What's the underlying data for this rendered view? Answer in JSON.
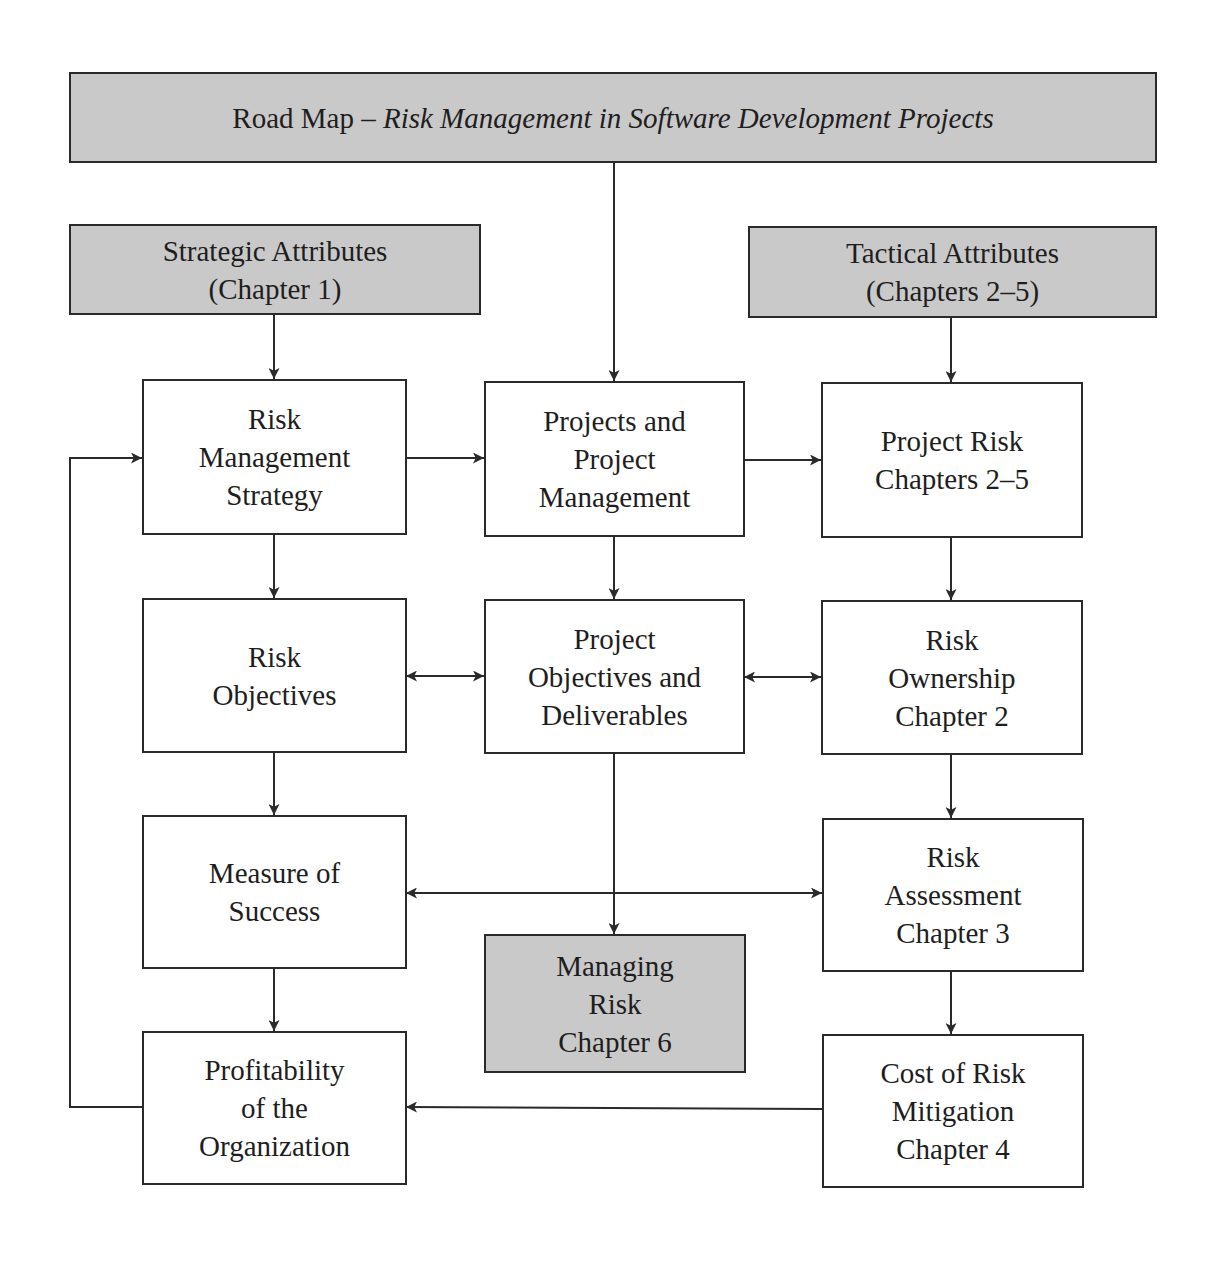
{
  "title": {
    "prefix": "Road Map – ",
    "italic": "Risk Management in Software Development Projects"
  },
  "nodes": {
    "strategic": {
      "lines": [
        "Strategic Attributes",
        "(Chapter 1)"
      ]
    },
    "tactical": {
      "lines": [
        "Tactical Attributes",
        "(Chapters 2–5)"
      ]
    },
    "rm_strategy": {
      "lines": [
        "Risk",
        "Management",
        "Strategy"
      ]
    },
    "projects": {
      "lines": [
        "Projects and",
        "Project",
        "Management"
      ]
    },
    "project_risk": {
      "lines": [
        "Project Risk",
        "Chapters 2–5"
      ]
    },
    "risk_objectives": {
      "lines": [
        "Risk",
        "Objectives"
      ]
    },
    "project_objectives": {
      "lines": [
        "Project",
        "Objectives and",
        "Deliverables"
      ]
    },
    "risk_ownership": {
      "lines": [
        "Risk",
        "Ownership",
        "Chapter 2"
      ]
    },
    "measure_success": {
      "lines": [
        "Measure of",
        "Success"
      ]
    },
    "managing_risk": {
      "lines": [
        "Managing",
        "Risk",
        "Chapter 6"
      ]
    },
    "risk_assessment": {
      "lines": [
        "Risk",
        "Assessment",
        "Chapter 3"
      ]
    },
    "profitability": {
      "lines": [
        "Profitability",
        "of the",
        "Organization"
      ]
    },
    "cost_mitigation": {
      "lines": [
        "Cost of Risk",
        "Mitigation",
        "Chapter 4"
      ]
    }
  },
  "edges": [
    {
      "from": "title",
      "to": "projects",
      "type": "one-way"
    },
    {
      "from": "strategic",
      "to": "rm_strategy",
      "type": "one-way"
    },
    {
      "from": "tactical",
      "to": "project_risk",
      "type": "one-way"
    },
    {
      "from": "rm_strategy",
      "to": "projects",
      "type": "one-way"
    },
    {
      "from": "projects",
      "to": "project_risk",
      "type": "one-way"
    },
    {
      "from": "rm_strategy",
      "to": "risk_objectives",
      "type": "one-way"
    },
    {
      "from": "projects",
      "to": "project_objectives",
      "type": "one-way"
    },
    {
      "from": "project_risk",
      "to": "risk_ownership",
      "type": "one-way"
    },
    {
      "from": "risk_objectives",
      "to": "project_objectives",
      "type": "two-way"
    },
    {
      "from": "project_objectives",
      "to": "risk_ownership",
      "type": "two-way"
    },
    {
      "from": "risk_objectives",
      "to": "measure_success",
      "type": "one-way"
    },
    {
      "from": "risk_ownership",
      "to": "risk_assessment",
      "type": "one-way"
    },
    {
      "from": "measure_success",
      "to": "risk_assessment",
      "type": "two-way"
    },
    {
      "from": "project_objectives",
      "to": "managing_risk",
      "type": "one-way"
    },
    {
      "from": "measure_success",
      "to": "profitability",
      "type": "one-way"
    },
    {
      "from": "risk_assessment",
      "to": "cost_mitigation",
      "type": "one-way"
    },
    {
      "from": "cost_mitigation",
      "to": "profitability",
      "type": "one-way"
    },
    {
      "from": "profitability",
      "to": "rm_strategy",
      "type": "one-way (feedback loop)"
    }
  ],
  "colors": {
    "shaded_fill": "#c9c9c9",
    "box_fill": "#ffffff",
    "stroke": "#2a2a2a"
  }
}
